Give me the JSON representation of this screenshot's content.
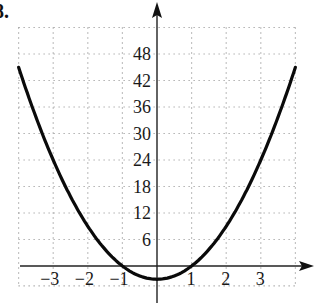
{
  "problem_number": "8.",
  "chart_data": {
    "type": "line",
    "title": "",
    "function": "y = 3x^2 - 3",
    "xlabel": "",
    "ylabel": "",
    "xlim": [
      -4,
      4
    ],
    "ylim": [
      -6,
      54
    ],
    "grid": true,
    "grid_style": "dotted",
    "x_ticks": [
      -3,
      -2,
      -1,
      1,
      2,
      3
    ],
    "x_tick_labels": [
      "−3",
      "−2",
      "−1",
      "1",
      "2",
      "3"
    ],
    "y_ticks": [
      6,
      12,
      18,
      24,
      30,
      36,
      42,
      48
    ],
    "y_tick_labels": [
      "6",
      "12",
      "18",
      "24",
      "30",
      "36",
      "42",
      "48"
    ],
    "series": [
      {
        "name": "parabola",
        "x": [
          -4,
          -3,
          -2,
          -1,
          0,
          1,
          2,
          3,
          4
        ],
        "values": [
          45,
          24,
          9,
          0,
          -3,
          0,
          9,
          24,
          45
        ]
      }
    ],
    "vertex": [
      0,
      -3
    ],
    "x_intercepts": [
      -1,
      1
    ],
    "legend": null
  }
}
